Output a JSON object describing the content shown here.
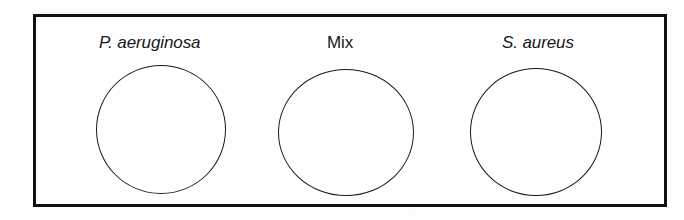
{
  "figure": {
    "type": "schematic-diagram",
    "background_color": "#ffffff",
    "frame": {
      "border_color": "#111111",
      "border_width_px": 3,
      "fill_color": "#ffffff"
    },
    "circle_style": {
      "stroke_color": "#1a1a1a",
      "stroke_width_px": 1.3,
      "fill_color": "#ffffff"
    },
    "items": [
      {
        "id": "p-aeruginosa",
        "label": "P. aeruginosa",
        "label_style": "italic"
      },
      {
        "id": "mix",
        "label": "Mix",
        "label_style": "upright"
      },
      {
        "id": "s-aureus",
        "label": "S. aureus",
        "label_style": "italic"
      }
    ]
  }
}
